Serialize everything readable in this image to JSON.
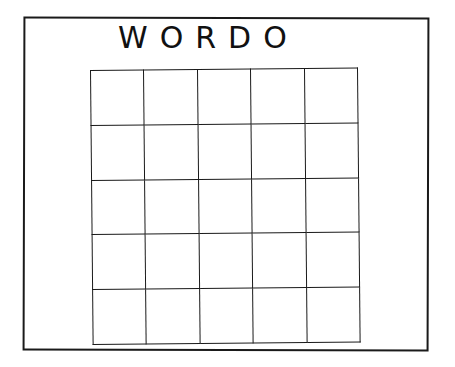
{
  "card": {
    "title": "WORDO",
    "grid": {
      "rows": 5,
      "cols": 5,
      "cells": [
        [
          "",
          "",
          "",
          "",
          ""
        ],
        [
          "",
          "",
          "",
          "",
          ""
        ],
        [
          "",
          "",
          "",
          "",
          ""
        ],
        [
          "",
          "",
          "",
          "",
          ""
        ],
        [
          "",
          "",
          "",
          "",
          ""
        ]
      ]
    }
  }
}
